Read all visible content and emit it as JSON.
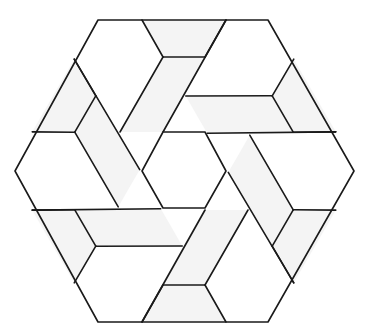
{
  "figure": {
    "title": "Hexagonal interlocking tiling pattern",
    "width": 367,
    "height": 334,
    "center": [
      184,
      171
    ],
    "stroke_color": "#1a1a1a",
    "stroke_width": 1.6,
    "fill_light": "#f4f4f4",
    "fill_white": "#ffffff",
    "outer_hexagon": [
      [
        98,
        20
      ],
      [
        268,
        20
      ],
      [
        354,
        171
      ],
      [
        268,
        322
      ],
      [
        98,
        322
      ],
      [
        15,
        171
      ]
    ],
    "inner_hexagon": [
      [
        163,
        132
      ],
      [
        205,
        132
      ],
      [
        226,
        171
      ],
      [
        205,
        208
      ],
      [
        163,
        208
      ],
      [
        142,
        171
      ]
    ],
    "blade_segments": [
      [
        [
          142,
          20
        ],
        [
          163,
          57
        ]
      ],
      [
        [
          163,
          57
        ],
        [
          205,
          57
        ]
      ],
      [
        [
          205,
          57
        ],
        [
          226,
          20
        ]
      ],
      [
        [
          226,
          20
        ],
        [
          163,
          132
        ]
      ],
      [
        [
          163,
          57
        ],
        [
          120,
          132
        ]
      ]
    ],
    "rotation_count": 6,
    "shaded_blade_polygons": [
      [
        [
          142,
          20
        ],
        [
          226,
          20
        ],
        [
          205,
          57
        ],
        [
          163,
          57
        ]
      ],
      [
        [
          163,
          57
        ],
        [
          205,
          57
        ],
        [
          163,
          132
        ],
        [
          142,
          132
        ],
        [
          120,
          132
        ]
      ]
    ]
  }
}
